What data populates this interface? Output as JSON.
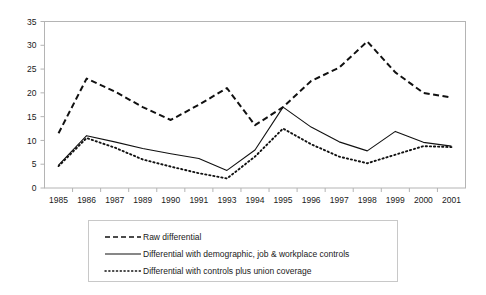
{
  "chart_data": {
    "type": "line",
    "title": "",
    "xlabel": "",
    "ylabel": "",
    "categories": [
      "1985",
      "1986",
      "1987",
      "1989",
      "1990",
      "1991",
      "1993",
      "1994",
      "1995",
      "1996",
      "1997",
      "1998",
      "1999",
      "2000",
      "2001"
    ],
    "ylim": [
      0,
      35
    ],
    "yticks": [
      0,
      5,
      10,
      15,
      20,
      25,
      30,
      35
    ],
    "grid": false,
    "legend_position": "bottom",
    "series": [
      {
        "name": "Raw differential",
        "style": "dashed",
        "color": "#111111",
        "values": [
          11.5,
          23.0,
          20.3,
          17.0,
          14.3,
          17.5,
          21.0,
          13.2,
          17.0,
          22.5,
          25.3,
          30.8,
          24.3,
          20.0,
          19.0
        ]
      },
      {
        "name": "Differential with demographic, job & workplace controls",
        "style": "solid",
        "color": "#111111",
        "values": [
          4.8,
          11.0,
          9.7,
          8.3,
          7.2,
          6.2,
          3.7,
          8.0,
          17.0,
          12.8,
          9.7,
          7.8,
          11.9,
          9.6,
          8.8
        ]
      },
      {
        "name": "Differential with controls plus union coverage",
        "style": "dotted",
        "color": "#111111",
        "values": [
          4.6,
          10.5,
          8.5,
          6.0,
          4.5,
          3.1,
          2.0,
          6.6,
          12.5,
          9.2,
          6.6,
          5.2,
          7.0,
          8.8,
          8.6
        ]
      }
    ],
    "series_extra": {
      "raw_tail": [
        18.8,
        18.5,
        12.0
      ],
      "solid_tail": [
        4.9,
        4.6
      ],
      "dotted_tail": [
        3.0,
        2.3
      ]
    }
  },
  "axes": {
    "y_tick_labels": [
      "35",
      "30",
      "25",
      "20",
      "15",
      "10",
      "5",
      "0"
    ],
    "x_tick_labels": [
      "1985",
      "1986",
      "1987",
      "1989",
      "1990",
      "1991",
      "1993",
      "1994",
      "1995",
      "1996",
      "1997",
      "1998",
      "1999",
      "2000",
      "2001"
    ]
  },
  "legend": {
    "items": [
      {
        "label": "Raw differential",
        "style": "dashed"
      },
      {
        "label": "Differential with demographic, job & workplace controls",
        "style": "solid"
      },
      {
        "label": "Differential with controls plus union coverage",
        "style": "dotted"
      }
    ]
  }
}
